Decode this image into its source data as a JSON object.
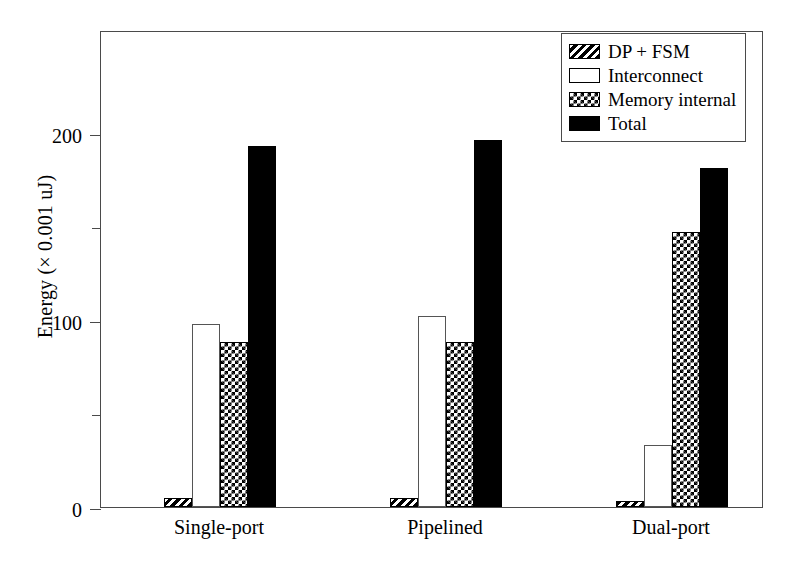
{
  "chart_data": {
    "type": "bar",
    "title": "",
    "subtitle": "",
    "xlabel": "",
    "ylabel": "Energy (× 0.001 uJ)",
    "categories": [
      "Single-port",
      "Pipelined",
      "Dual-port"
    ],
    "series": [
      {
        "name": "DP + FSM",
        "fill": "diagonal-hatch",
        "values": [
          5,
          5,
          3
        ]
      },
      {
        "name": "Interconnect",
        "fill": "empty",
        "values": [
          98,
          102,
          33
        ]
      },
      {
        "name": "Memory internal",
        "fill": "checkerboard",
        "values": [
          88,
          88,
          147
        ]
      },
      {
        "name": "Total",
        "fill": "solid-black",
        "values": [
          193,
          196,
          181
        ]
      }
    ],
    "ylim": [
      0,
      255
    ],
    "ymajor_ticks": [
      0,
      100,
      200
    ],
    "ymajor_tick_labels": [
      "0",
      "100",
      "200"
    ],
    "yminor_ticks": [
      50,
      150
    ],
    "grid": false,
    "legend_position": "top-right",
    "colors": {
      "axis": "#4a4a4a",
      "bar_outline": "#000000",
      "solid_fill": "#000000",
      "background": "#ffffff"
    }
  },
  "legend": {
    "entries": [
      {
        "label": "DP + FSM"
      },
      {
        "label": "Interconnect"
      },
      {
        "label": "Memory internal"
      },
      {
        "label": "Total"
      }
    ]
  }
}
